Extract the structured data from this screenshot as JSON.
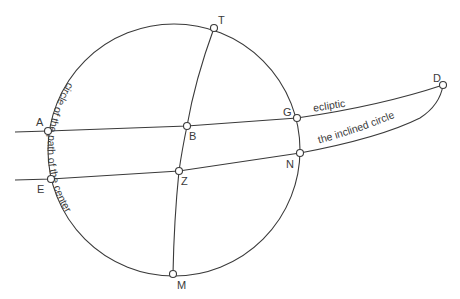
{
  "diagram": {
    "circle": {
      "cx": 174,
      "cy": 150,
      "r": 126
    },
    "points": [
      {
        "id": "T",
        "label": "T",
        "x": 214,
        "y": 28
      },
      {
        "id": "M",
        "label": "M",
        "x": 173,
        "y": 274
      },
      {
        "id": "A",
        "label": "A",
        "x": 48,
        "y": 131
      },
      {
        "id": "E",
        "label": "E",
        "x": 51,
        "y": 179
      },
      {
        "id": "B",
        "label": "B",
        "x": 187,
        "y": 126
      },
      {
        "id": "G",
        "label": "G",
        "x": 297,
        "y": 118
      },
      {
        "id": "Z",
        "label": "Z",
        "x": 179,
        "y": 171
      },
      {
        "id": "N",
        "label": "N",
        "x": 300,
        "y": 153
      },
      {
        "id": "D",
        "label": "D",
        "x": 443,
        "y": 85
      }
    ],
    "curve_labels": {
      "ecliptic": "ecliptic",
      "inclined": "the inclined circle",
      "center_path": "circle of the path of the center"
    },
    "line_color": "#3a3a3a"
  }
}
